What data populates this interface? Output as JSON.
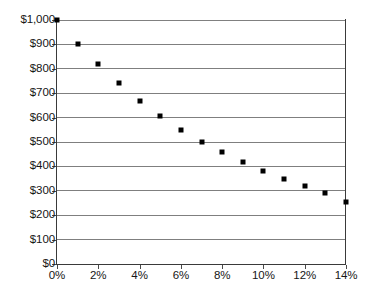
{
  "chart_data": {
    "type": "scatter",
    "title": "",
    "xlabel": "",
    "ylabel": "",
    "xlim": [
      0,
      14
    ],
    "ylim": [
      0,
      1000
    ],
    "grid": true,
    "legend": null,
    "x_tick_labels": [
      "0%",
      "2%",
      "4%",
      "6%",
      "8%",
      "10%",
      "12%",
      "14%"
    ],
    "x_tick_values": [
      0,
      2,
      4,
      6,
      8,
      10,
      12,
      14
    ],
    "y_tick_labels": [
      "$0",
      "$100",
      "$200",
      "$300",
      "$400",
      "$500",
      "$600",
      "$700",
      "$800",
      "$900",
      "$1,000"
    ],
    "y_tick_values": [
      0,
      100,
      200,
      300,
      400,
      500,
      600,
      700,
      800,
      900,
      1000
    ],
    "x": [
      0,
      1,
      2,
      3,
      4,
      5,
      6,
      7,
      8,
      9,
      10,
      11,
      12,
      13,
      14
    ],
    "values": [
      1000,
      900,
      820,
      740,
      670,
      605,
      550,
      500,
      460,
      420,
      380,
      350,
      320,
      290,
      255
    ],
    "marker": "square",
    "marker_color": "#000000"
  }
}
